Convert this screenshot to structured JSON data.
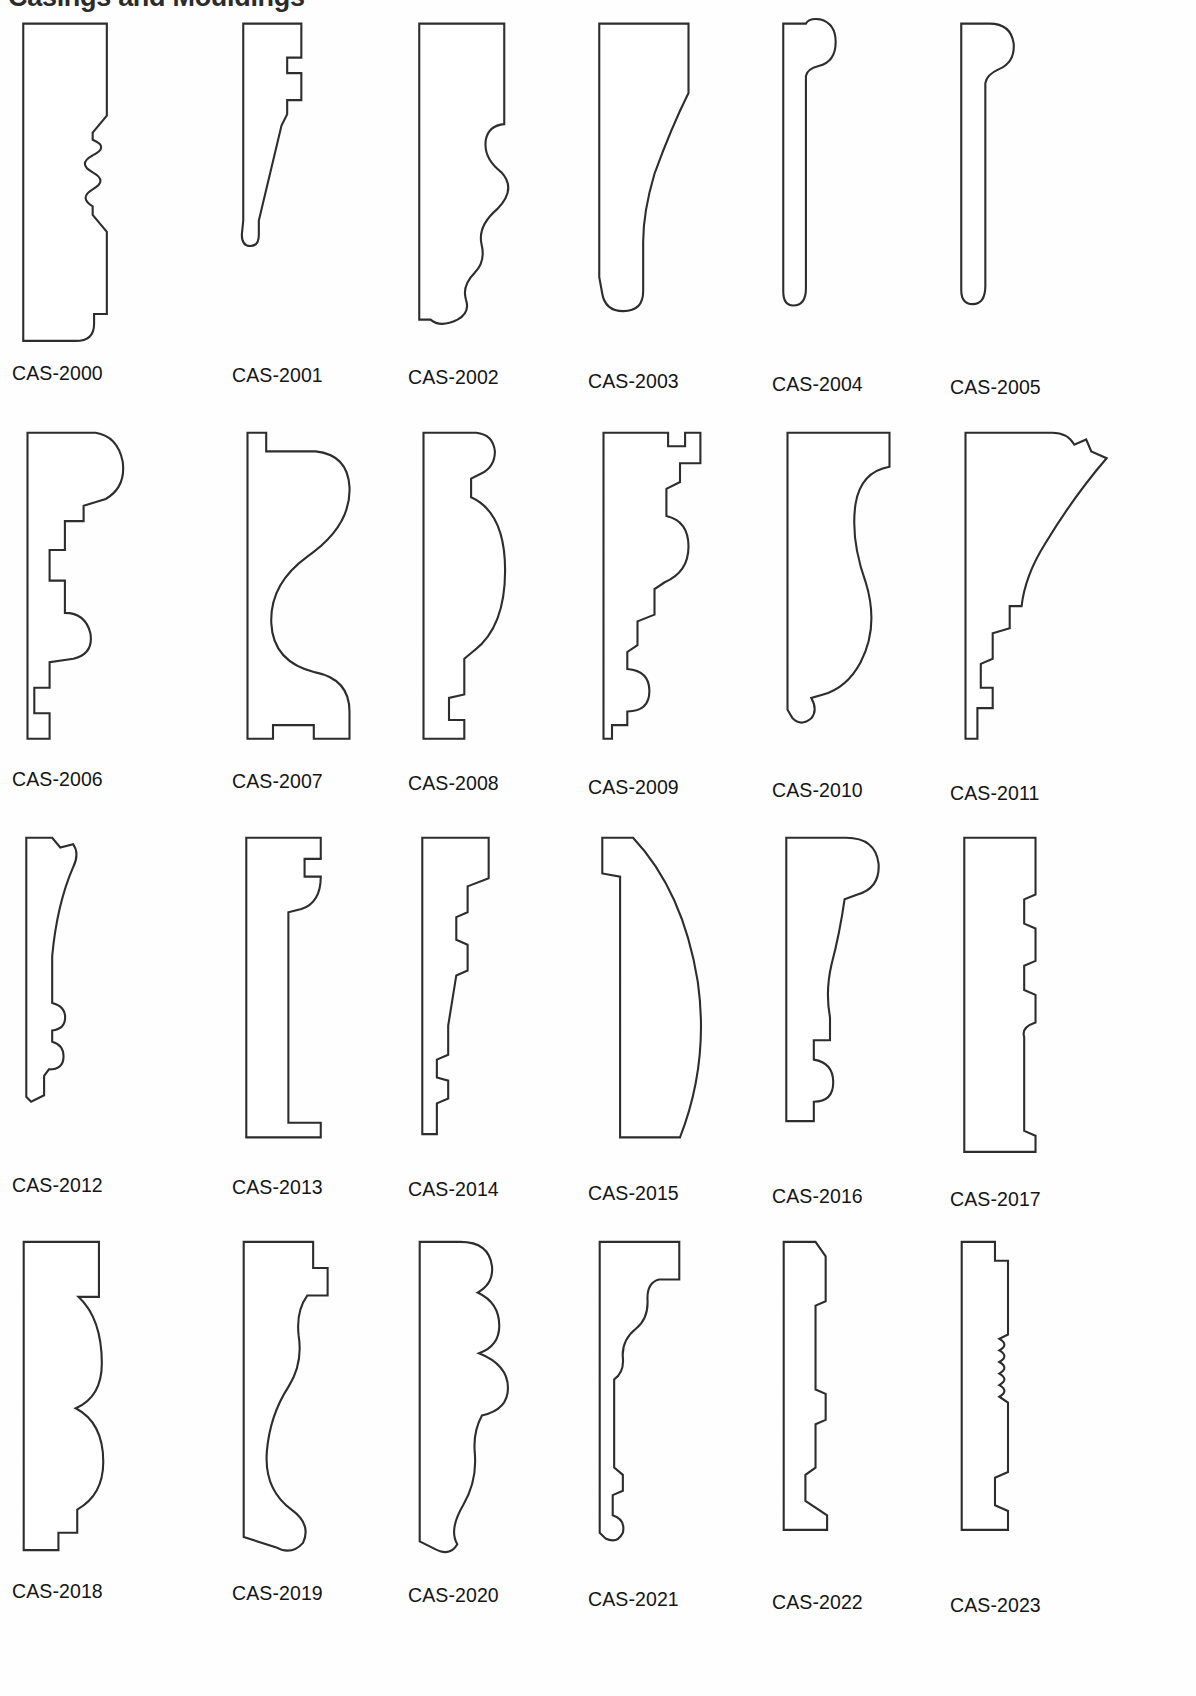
{
  "page": {
    "heading": "Casings and Mouldings",
    "background_color": "#ffffff",
    "line_color": "#2d2d2d",
    "text_color": "#151515",
    "columns": 6,
    "rows": 4,
    "total_items": 24
  },
  "items": [
    {
      "label": "CAS-2000",
      "name": "profile-cas-2000",
      "description": "flat back casing with stepped top, central reeded wave band and quarter-round foot",
      "path": "M 30 22 L 148 22 L 148 152 L 128 176 L 128 186 Q 152 196 128 208 Q 106 220 128 232 Q 150 244 128 256 Q 108 268 128 280 L 128 292 L 148 316 L 148 432 L 130 432 L 130 446 Q 130 470 104 470 L 30 470 Z"
    },
    {
      "label": "CAS-2001",
      "name": "profile-cas-2001",
      "description": "narrow tapered casing with stepped bead near top and rounded toe",
      "path": "M 30 22 L 112 22 L 112 70 L 92 70 L 92 92 L 112 92 L 112 130 L 92 130 L 92 150 L 84 166 L 52 300 L 52 320 Q 52 336 40 336 Q 28 336 28 320 L 30 300 Z"
    },
    {
      "label": "CAS-2002",
      "name": "profile-cas-2002",
      "description": "ogee casing: large cyma recta over small bead and rounded toe",
      "path": "M 30 22 L 150 22 L 150 164 Q 128 166 124 186 Q 120 212 146 232 Q 168 256 140 284 Q 112 308 118 334 Q 124 358 108 374 Q 90 392 96 412 Q 102 430 84 440 Q 60 452 46 440 L 30 440 Z"
    },
    {
      "label": "CAS-2003",
      "name": "profile-cas-2003",
      "description": "cove casing: deep concave sweep with square fillet foot",
      "path": "M 30 22 L 156 22 L 156 120 Q 132 168 108 234 Q 92 288 92 330 L 92 400 Q 92 428 64 428 Q 38 428 34 402 L 30 380 Z"
    },
    {
      "label": "CAS-2004",
      "name": "profile-cas-2004",
      "description": "thin backband with round bullnose head and small toe",
      "path": "M 30 22 L 62 22 Q 66 14 82 16 Q 104 22 104 48 Q 104 76 80 82 Q 64 86 62 96 L 62 396 Q 62 420 44 420 Q 30 420 30 400 Z"
    },
    {
      "label": "CAS-2005",
      "name": "profile-cas-2005",
      "description": "thin backband with large round head and flat body",
      "path": "M 30 22 L 70 22 Q 100 22 104 50 Q 106 76 84 86 Q 66 94 64 106 L 64 392 Q 64 418 46 418 Q 30 418 30 398 Z"
    },
    {
      "label": "CAS-2006",
      "name": "profile-cas-2006",
      "description": "stepped multi-band casing with ogee head and stacked fillets",
      "path": "M 30 22 L 110 22 Q 136 26 142 56 Q 146 86 122 100 L 96 108 L 96 126 L 74 126 L 74 160 L 56 160 L 56 196 L 74 196 L 74 234 Q 98 234 104 258 Q 108 282 84 288 L 56 292 L 56 322 L 38 322 L 38 352 L 56 352 L 56 382 L 30 382 Z"
    },
    {
      "label": "CAS-2007",
      "name": "profile-cas-2007",
      "description": "large S-curve cyma reversa with square base block",
      "path": "M 30 22 L 52 22 L 52 44 L 110 44 Q 148 48 150 86 Q 152 132 100 168 Q 56 200 58 246 Q 60 292 110 304 Q 150 312 150 350 L 150 382 L 108 382 L 108 366 L 60 366 L 60 382 L 30 382 Z"
    },
    {
      "label": "CAS-2008",
      "name": "profile-cas-2008",
      "description": "slim casing with bulging belly curve and stepped base",
      "path": "M 30 22 L 92 22 Q 112 24 114 44 Q 114 62 98 70 L 86 76 L 86 98 Q 126 116 126 184 Q 126 250 90 278 L 78 288 L 78 330 L 60 334 L 60 360 L 78 360 L 78 382 L 30 382 Z"
    },
    {
      "label": "CAS-2009",
      "name": "profile-cas-2009",
      "description": "stepped colonial casing with multiple fillets, cove and bead foot",
      "path": "M 30 22 L 106 22 L 106 38 L 126 38 L 126 22 L 144 22 L 144 58 L 120 58 L 120 80 L 104 88 L 104 120 Q 130 126 130 156 Q 130 186 102 198 L 90 206 L 90 236 L 70 244 L 70 272 L 58 280 L 58 300 Q 84 302 84 326 Q 84 350 58 350 L 58 366 L 40 366 L 40 382 L 30 382 Z"
    },
    {
      "label": "CAS-2010",
      "name": "profile-cas-2010",
      "description": "wide casing with long sweeping cove and small bead at the base",
      "path": "M 30 22 L 150 22 L 150 62 Q 116 68 110 106 Q 104 148 122 198 Q 138 250 116 292 Q 100 322 72 330 L 58 334 Q 66 348 58 358 Q 46 368 36 358 L 30 348 Z"
    },
    {
      "label": "CAS-2011",
      "name": "profile-cas-2011",
      "description": "flaring crown-type casing with long upper sweep and stepped fillets",
      "path": "M 30 22 L 132 22 Q 150 22 158 36 L 172 30 L 178 44 L 196 52 Q 158 96 124 152 Q 100 190 96 226 L 82 226 L 82 252 L 62 258 L 62 288 L 48 294 L 48 322 L 62 322 L 62 346 L 44 346 L 44 382 L 30 382 Z"
    },
    {
      "label": "CAS-2012",
      "name": "profile-cas-2012",
      "description": "narrow backband with chamfered head, long flat face and small bead foot",
      "path": "M 30 22 L 62 22 L 72 34 L 88 30 Q 96 42 88 58 Q 68 104 62 168 L 62 226 Q 78 230 78 244 Q 78 258 62 260 L 62 274 Q 76 278 76 292 Q 76 308 58 308 L 52 316 L 52 340 L 36 348 L 30 342 Z"
    },
    {
      "label": "CAS-2013",
      "name": "profile-cas-2013",
      "description": "plain flat casing with a single bead below the stepped head",
      "path": "M 30 22 L 122 22 L 122 48 L 102 48 L 102 70 L 122 70 Q 122 102 98 110 L 82 114 L 82 374 L 122 374 L 122 392 L 30 392 Z"
    },
    {
      "label": "CAS-2014",
      "name": "profile-cas-2014",
      "description": "slim stepped casing with narrow flat shank and small stacked fillets",
      "path": "M 30 22 L 112 22 L 112 72 L 86 82 L 86 114 L 72 120 L 72 148 L 86 154 L 86 186 L 72 192 L 62 254 L 62 290 L 48 296 L 48 318 L 62 322 L 62 344 L 48 350 L 48 388 L 30 388 Z"
    },
    {
      "label": "CAS-2015",
      "name": "profile-cas-2015",
      "description": "simple convex elliptical bullnose casing with small rabbet at the top",
      "path": "M 30 22 L 68 22 Q 130 88 148 200 Q 162 300 126 392 L 52 392 L 52 70 L 30 66 Z"
    },
    {
      "label": "CAS-2016",
      "name": "profile-cas-2016",
      "description": "casing with round head bead, long cove and stepped base fillets",
      "path": "M 30 22 L 104 22 Q 140 22 144 54 Q 146 84 118 92 L 102 98 Q 96 140 86 178 Q 78 212 84 244 L 84 272 L 64 272 L 64 296 Q 88 300 88 324 Q 88 348 64 348 L 64 372 L 30 372 Z"
    },
    {
      "label": "CAS-2017",
      "name": "profile-cas-2017",
      "description": "fluted pilaster casing: slim flat body with a run of small reeds",
      "path": "M 30 22 L 118 22 L 118 92 L 104 98 L 104 128 L 118 134 L 118 174 L 104 180 L 104 210 L 118 216 L 118 250 Q 100 256 104 268 L 104 384 L 118 390 L 118 410 L 30 410 Z"
    },
    {
      "label": "CAS-2018",
      "name": "profile-cas-2018",
      "description": "three-bead casing: large quarter-round, half-round and torus stack",
      "path": "M 30 22 L 134 22 L 134 98 L 106 98 Q 138 128 138 190 Q 138 236 102 252 Q 140 272 140 326 Q 140 372 104 392 L 104 424 L 78 424 L 78 448 L 30 448 Z"
    },
    {
      "label": "CAS-2019",
      "name": "profile-cas-2019",
      "description": "large cyma casing with stepped head and swept cove to a bead foot",
      "path": "M 30 22 L 126 22 L 126 58 L 146 58 L 146 96 L 118 96 Q 102 118 106 152 Q 112 190 92 222 Q 66 262 62 312 Q 58 364 96 392 Q 124 412 112 438 Q 96 456 74 444 L 30 430 Z"
    },
    {
      "label": "CAS-2020",
      "name": "profile-cas-2020",
      "description": "ornate casing with scalloped head, bead cluster and deep cove",
      "path": "M 30 22 L 86 22 Q 126 22 130 56 Q 132 80 110 92 Q 140 106 140 138 Q 140 166 112 176 Q 152 192 152 224 Q 152 254 116 262 Q 104 284 106 312 Q 110 352 90 386 Q 70 420 82 440 Q 72 458 50 446 L 30 436 Z"
    },
    {
      "label": "CAS-2021",
      "name": "profile-cas-2021",
      "description": "stepped casing with double ogee and narrow shank to a bead toe",
      "path": "M 30 22 L 140 22 L 140 74 L 112 74 Q 96 78 96 100 Q 98 128 80 142 Q 60 158 62 182 Q 64 202 50 212 L 50 334 L 62 344 L 62 366 L 48 372 L 48 400 Q 66 406 62 424 Q 54 440 38 432 L 30 424 Z"
    },
    {
      "label": "CAS-2022",
      "name": "profile-cas-2022",
      "description": "thin back band with chamfered head, stepped shank and splayed foot",
      "path": "M 30 22 L 74 22 L 88 42 L 88 104 L 74 110 L 74 226 L 88 232 L 88 268 L 74 274 L 74 334 L 60 344 L 60 380 L 90 400 L 90 420 L 30 420 Z"
    },
    {
      "label": "CAS-2023",
      "name": "profile-cas-2023",
      "description": "reeded slim casing with fine bead run in the middle of a flat face",
      "path": "M 30 22 L 76 22 L 76 48 L 94 48 L 94 150 L 82 156 Q 96 164 82 172 Q 96 180 82 188 Q 96 196 82 204 Q 96 212 82 220 Q 96 228 82 236 L 94 244 L 94 340 L 76 348 L 76 386 L 94 394 L 94 420 L 30 420 Z"
    }
  ]
}
